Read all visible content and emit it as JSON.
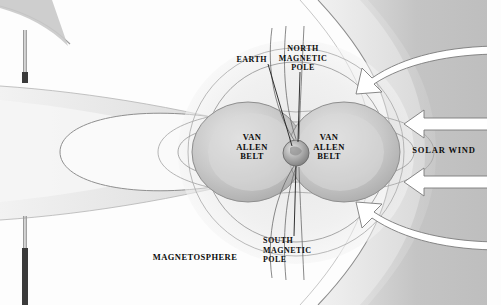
{
  "diagram": {
    "type": "scientific-illustration",
    "style": "grayscale halftone airbrush",
    "background_color": "#fdfdfd",
    "ink_color": "#0d0d0d"
  },
  "labels": {
    "earth": "EARTH",
    "north_magnetic_pole": "NORTH\nMAGNETIC\nPOLE",
    "south_magnetic_pole": "SOUTH\nMAGNETIC\nPOLE",
    "van_allen_belt_left": "VAN\nALLEN\nBELT",
    "van_allen_belt_right": "VAN\nALLEN\nBELT",
    "magnetosphere": "MAGNETOSPHERE",
    "solar_wind": "SOLAR WIND"
  },
  "features": {
    "earth_sphere": "shaded sphere at diagram center",
    "dipole_field_lines": "nested magnetic field loops converging at poles",
    "van_allen_lobes": "two large gray radiation belt lobes flanking Earth",
    "magnetotail": "elongated tapering tail extending to the left",
    "bow_shock": "curved boundary on the sunward right side",
    "solar_wind_arrows": "three straight white arrows pointing left",
    "deflected_arrows": "two curved white arrows sweeping around the bow shock",
    "left_markers": "two thin vertical register bars at the left margin"
  },
  "colors": {
    "belt_gray": "#b9b9b9",
    "field_gray": "#d2d2d2",
    "solar_wind_gray": "#c6c6c6",
    "tail_gray": "#e4e4e4",
    "arrow_fill": "#ffffff",
    "arrow_stroke": "#6f6f6f",
    "marker_dark": "#3b3b3b"
  }
}
